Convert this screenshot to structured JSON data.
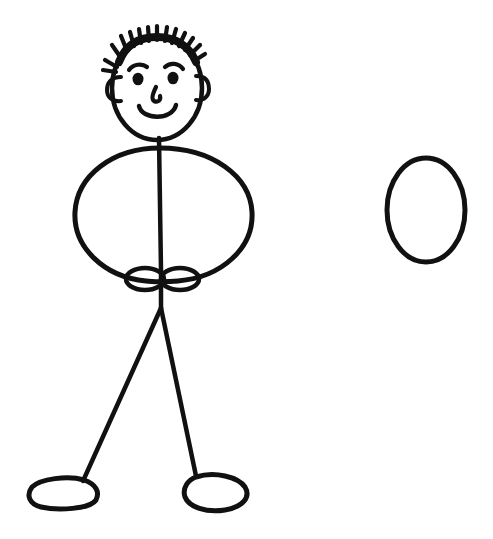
{
  "document": {
    "title": "Stick Figure Drawing",
    "kind": "line-drawing",
    "description": "Hand-drawn black ink stick figure of a smiling person with spiky hair standing beside a separate empty oval",
    "background_color": "#ffffff",
    "ink_color": "#111111",
    "canvas": {
      "width": 493,
      "height": 539
    }
  },
  "figure": {
    "name": "stick-person",
    "head": {
      "label": "head",
      "center_x": 157,
      "center_y": 88,
      "radius_x": 45,
      "radius_y": 52,
      "stroke_width": 4.5
    },
    "hair": {
      "label": "spiky-hair",
      "spike_count": 14,
      "band_stroke_width": 7,
      "spike_stroke_width": 4,
      "span_x": [
        118,
        196
      ],
      "top_y": 32
    },
    "eyes": {
      "label": "eyes",
      "left": {
        "x": 138,
        "y": 79,
        "radius": 5.5
      },
      "right": {
        "x": 173,
        "y": 78,
        "radius": 5.5
      }
    },
    "eyebrows": {
      "label": "eyebrows",
      "left": {
        "x": 138,
        "y": 68
      },
      "right": {
        "x": 174,
        "y": 66
      },
      "stroke_width": 4
    },
    "nose": {
      "label": "nose",
      "x": 156,
      "y": 96,
      "radius_x": 5,
      "radius_y": 8
    },
    "mouth": {
      "label": "smiling-mouth",
      "center_x": 157,
      "center_y": 110,
      "width": 38,
      "depth": 14,
      "stroke_width": 4.5
    },
    "ears": {
      "label": "ears",
      "left": {
        "x": 114,
        "y": 89,
        "radius_x": 7,
        "radius_y": 12
      },
      "right": {
        "x": 201,
        "y": 88,
        "radius_x": 7,
        "radius_y": 12
      },
      "stroke_width": 4
    },
    "neck": {
      "label": "neck-and-spine-line",
      "x": 160,
      "from_y": 138,
      "to_y": 330,
      "stroke_width": 4.5
    },
    "torso": {
      "label": "torso-oval",
      "center_x": 164,
      "center_y": 218,
      "radius_x": 90,
      "radius_y": 72,
      "stroke_width": 5
    },
    "hands": {
      "label": "hands",
      "left": {
        "x": 145,
        "y": 279,
        "radius_x": 20,
        "radius_y": 12
      },
      "right": {
        "x": 180,
        "y": 279,
        "radius_x": 20,
        "radius_y": 12
      },
      "stroke_width": 4.5
    },
    "legs": {
      "label": "legs",
      "hip": {
        "x": 161,
        "y": 308
      },
      "left_foot_joint": {
        "x": 83,
        "y": 481
      },
      "right_foot_joint": {
        "x": 196,
        "y": 476
      },
      "stroke_width": 4.5
    },
    "feet": {
      "label": "feet",
      "left": {
        "center_x": 62,
        "center_y": 494,
        "radius_x": 34,
        "radius_y": 16
      },
      "right": {
        "center_x": 216,
        "center_y": 492,
        "radius_x": 32,
        "radius_y": 19
      },
      "stroke_width": 5
    }
  },
  "standalone_shape": {
    "name": "empty-oval",
    "label": "oval",
    "center_x": 426,
    "center_y": 210,
    "radius_x": 39,
    "radius_y": 52,
    "stroke_width": 5
  }
}
